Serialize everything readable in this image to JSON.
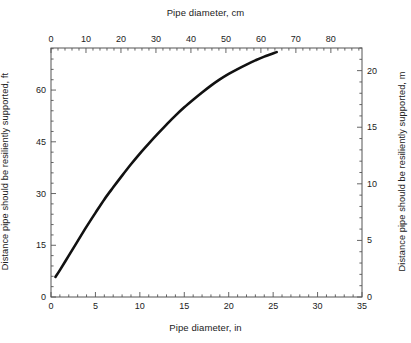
{
  "figure": {
    "background": "#ffffff",
    "line_color": "#111111",
    "axis_color": "#555555"
  },
  "chart_data": {
    "type": "line",
    "title": "",
    "xlabel": "Pipe diameter, in",
    "ylabel": "Distance pipe should be resiliently supported, ft",
    "xlabel_top": "Pipe diameter, cm",
    "ylabel_right": "Distance pipe should be resiliently supported, m",
    "xlim": [
      0,
      35
    ],
    "ylim": [
      0,
      72.2
    ],
    "xlim_top_cm": [
      0,
      88.9
    ],
    "ylim_right_m": [
      0,
      22.0
    ],
    "grid": false,
    "legend": null,
    "xticks": [
      0,
      5,
      10,
      15,
      20,
      25,
      30,
      35
    ],
    "xticklabels": [
      "0",
      "5",
      "10",
      "15",
      "20",
      "25",
      "30",
      "35"
    ],
    "xticks_top_cm": [
      0,
      10,
      20,
      30,
      40,
      50,
      60,
      70,
      80
    ],
    "xticklabels_top": [
      "0",
      "10",
      "20",
      "30",
      "40",
      "50",
      "60",
      "70",
      "80"
    ],
    "yticks": [
      0,
      15,
      30,
      45,
      60
    ],
    "yticklabels": [
      "0",
      "15",
      "30",
      "45",
      "60"
    ],
    "yticks_right_m": [
      0,
      5,
      10,
      15,
      20
    ],
    "yticklabels_right": [
      "0",
      "5",
      "10",
      "15",
      "20"
    ],
    "x": [
      0.5,
      1,
      2,
      3,
      4,
      5,
      6,
      7,
      8,
      9,
      10,
      11,
      12,
      13,
      14,
      15,
      16,
      17,
      18,
      19,
      20,
      21,
      22,
      23,
      24,
      25.4
    ],
    "values": [
      5.8,
      7.8,
      12.0,
      16.2,
      20.4,
      24.4,
      28.3,
      31.8,
      35.2,
      38.5,
      41.6,
      44.5,
      47.3,
      50.0,
      52.6,
      55.0,
      57.2,
      59.3,
      61.3,
      63.1,
      64.7,
      66.1,
      67.4,
      68.6,
      69.7,
      71.0
    ],
    "series_name": "Support spacing"
  }
}
